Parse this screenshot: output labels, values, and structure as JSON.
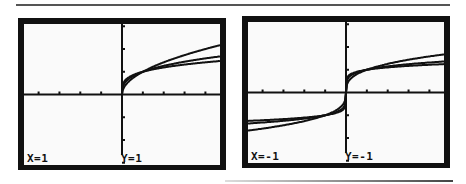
{
  "chart_data": [
    {
      "type": "line",
      "title": "",
      "screen": "left",
      "xlabel": "",
      "ylabel": "",
      "grid": false,
      "legend": null,
      "trace_label_x": "X=1",
      "trace_label_y": "Y=1",
      "xlim": [
        -4.7,
        4.7
      ],
      "ylim": [
        -3.1,
        3.1
      ],
      "series": [
        {
          "name": "y = x^(1/2)",
          "x": [
            0,
            0.1,
            0.25,
            0.5,
            1,
            2,
            3,
            4,
            4.7
          ],
          "y": [
            0,
            0.32,
            0.5,
            0.71,
            1,
            1.41,
            1.73,
            2.0,
            2.17
          ]
        },
        {
          "name": "y = x^(1/3)",
          "x": [
            0,
            0.1,
            0.25,
            0.5,
            1,
            2,
            3,
            4,
            4.7
          ],
          "y": [
            0,
            0.46,
            0.63,
            0.79,
            1,
            1.26,
            1.44,
            1.59,
            1.68
          ]
        },
        {
          "name": "y = x^(1/4)",
          "x": [
            0,
            0.1,
            0.25,
            0.5,
            1,
            2,
            3,
            4,
            4.7
          ],
          "y": [
            0,
            0.56,
            0.71,
            0.84,
            1,
            1.19,
            1.32,
            1.41,
            1.47
          ]
        }
      ]
    },
    {
      "type": "line",
      "title": "",
      "screen": "right",
      "xlabel": "",
      "ylabel": "",
      "grid": false,
      "legend": null,
      "trace_label_x": "X=-1",
      "trace_label_y": "Y=-1",
      "xlim": [
        -4.7,
        4.7
      ],
      "ylim": [
        -3.1,
        3.1
      ],
      "series": [
        {
          "name": "y = x^(1/3)",
          "x": [
            -4.7,
            -4,
            -3,
            -2,
            -1,
            -0.5,
            -0.1,
            0,
            0.1,
            0.5,
            1,
            2,
            3,
            4,
            4.7
          ],
          "y": [
            -1.68,
            -1.59,
            -1.44,
            -1.26,
            -1,
            -0.79,
            -0.46,
            0,
            0.46,
            0.79,
            1,
            1.26,
            1.44,
            1.59,
            1.68
          ]
        },
        {
          "name": "y = x^(1/5)",
          "x": [
            -4.7,
            -4,
            -3,
            -2,
            -1,
            -0.5,
            -0.1,
            0,
            0.1,
            0.5,
            1,
            2,
            3,
            4,
            4.7
          ],
          "y": [
            -1.36,
            -1.32,
            -1.25,
            -1.15,
            -1,
            -0.87,
            -0.63,
            0,
            0.63,
            0.87,
            1,
            1.15,
            1.25,
            1.32,
            1.36
          ]
        },
        {
          "name": "y = x^(1/7)",
          "x": [
            -4.7,
            -4,
            -3,
            -2,
            -1,
            -0.5,
            -0.1,
            0,
            0.1,
            0.5,
            1,
            2,
            3,
            4,
            4.7
          ],
          "y": [
            -1.25,
            -1.22,
            -1.17,
            -1.1,
            -1,
            -0.91,
            -0.72,
            0,
            0.72,
            0.91,
            1,
            1.1,
            1.17,
            1.22,
            1.25
          ]
        }
      ]
    }
  ],
  "screens": {
    "left": {
      "label_x": "X=1",
      "label_y": "Y=1"
    },
    "right": {
      "label_x": "X=-1",
      "label_y": "Y=-1"
    }
  }
}
